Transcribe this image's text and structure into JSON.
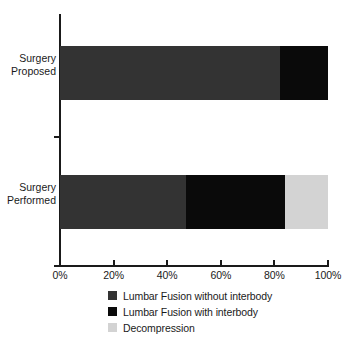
{
  "chart_data": {
    "type": "bar",
    "orientation": "horizontal",
    "stacked": true,
    "title": "",
    "xlabel": "",
    "ylabel": "",
    "categories": [
      "Surgery\nProposed",
      "Surgery\nPerformed"
    ],
    "series": [
      {
        "name": "Lumbar Fusion without interbody",
        "color": "#333333",
        "values": [
          82,
          47
        ]
      },
      {
        "name": "Lumbar Fusion with interbody",
        "color": "#0a0a0a",
        "values": [
          18,
          37
        ]
      },
      {
        "name": "Decompression",
        "color": "#d3d3d3",
        "values": [
          0,
          16
        ]
      }
    ],
    "xlim": [
      0,
      100
    ],
    "xticks": [
      0,
      20,
      40,
      60,
      80,
      100
    ],
    "xtick_labels": [
      "0%",
      "20%",
      "40%",
      "60%",
      "80%",
      "100%"
    ],
    "grid": false,
    "legend_position": "bottom"
  },
  "axis": {
    "ticks": [
      {
        "label": "0%",
        "value": 0
      },
      {
        "label": "20%",
        "value": 20
      },
      {
        "label": "40%",
        "value": 40
      },
      {
        "label": "60%",
        "value": 60
      },
      {
        "label": "80%",
        "value": 80
      },
      {
        "label": "100%",
        "value": 100
      }
    ]
  },
  "categories": [
    {
      "label": "Surgery\nProposed"
    },
    {
      "label": "Surgery\nPerformed"
    }
  ],
  "legend": {
    "items": [
      {
        "label": "Lumbar Fusion without interbody",
        "color": "#333333"
      },
      {
        "label": "Lumbar Fusion with interbody",
        "color": "#0a0a0a"
      },
      {
        "label": "Decompression",
        "color": "#d3d3d3"
      }
    ]
  },
  "colors": {
    "axis": "#1a1a1a",
    "text": "#1a1a1a",
    "background": "#ffffff",
    "fusion_without_interbody": "#333333",
    "fusion_with_interbody": "#0a0a0a",
    "decompression": "#d3d3d3"
  }
}
